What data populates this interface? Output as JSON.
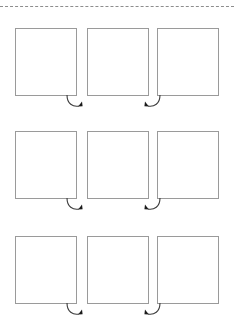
{
  "page": {
    "kind": "storyboard-panel-sheet",
    "background_color": "#ffffff",
    "width": 234,
    "height": 330
  },
  "tear_line": {
    "label": "cut-here-dashed-line",
    "color": "#8d8d8d",
    "style": "dashed",
    "dash_length": 8,
    "gap_length": 5
  },
  "grid": {
    "rows": 3,
    "columns": 3,
    "panel_border_color": "#9a9a9a",
    "panel_fill_color": "#ffffff",
    "panel_width": 62,
    "panel_height": 68,
    "panels": [
      {
        "row": 0,
        "col": 0,
        "content": ""
      },
      {
        "row": 0,
        "col": 1,
        "content": ""
      },
      {
        "row": 0,
        "col": 2,
        "content": ""
      },
      {
        "row": 1,
        "col": 0,
        "content": ""
      },
      {
        "row": 1,
        "col": 1,
        "content": ""
      },
      {
        "row": 1,
        "col": 2,
        "content": ""
      },
      {
        "row": 2,
        "col": 0,
        "content": ""
      },
      {
        "row": 2,
        "col": 1,
        "content": ""
      },
      {
        "row": 2,
        "col": 2,
        "content": ""
      }
    ]
  },
  "flow_arrows": {
    "color": "#333333",
    "count": 6,
    "items": [
      {
        "row": 0,
        "gutter": 0,
        "direction": "curve-right-up",
        "head_side": "right"
      },
      {
        "row": 0,
        "gutter": 1,
        "direction": "curve-left-up",
        "head_side": "left"
      },
      {
        "row": 1,
        "gutter": 0,
        "direction": "curve-right-up",
        "head_side": "right"
      },
      {
        "row": 1,
        "gutter": 1,
        "direction": "curve-left-up",
        "head_side": "left"
      },
      {
        "row": 2,
        "gutter": 0,
        "direction": "curve-right-up",
        "head_side": "right"
      },
      {
        "row": 2,
        "gutter": 1,
        "direction": "curve-left-up",
        "head_side": "left"
      }
    ]
  }
}
